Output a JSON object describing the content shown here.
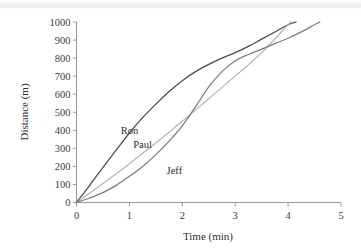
{
  "chart_data": {
    "type": "line",
    "title": "",
    "xlabel": "Time (min)",
    "ylabel": "Distance (m)",
    "xlim": [
      0,
      5
    ],
    "ylim": [
      0,
      1000
    ],
    "xticks": [
      "0",
      "1",
      "2",
      "3",
      "4",
      "5"
    ],
    "yticks": [
      "0",
      "100",
      "200",
      "300",
      "400",
      "500",
      "600",
      "700",
      "800",
      "900",
      "1000"
    ],
    "grid": false,
    "legend_position": "inline-labels",
    "series": [
      {
        "name": "Ron",
        "color": "#4a4a4a",
        "label_x": 1.0,
        "label_y": 380,
        "x": [
          0,
          0.25,
          0.5,
          0.75,
          1.0,
          1.25,
          1.5,
          1.75,
          2.0,
          2.25,
          2.5,
          2.75,
          3.0,
          3.25,
          3.5,
          3.75,
          4.0,
          4.15
        ],
        "y": [
          0,
          95,
          195,
          290,
          385,
          470,
          545,
          615,
          675,
          725,
          765,
          800,
          830,
          865,
          905,
          945,
          985,
          1000
        ]
      },
      {
        "name": "Paul",
        "color": "#b4b4b4",
        "label_x": 1.25,
        "label_y": 300,
        "x": [
          0,
          0.5,
          1.0,
          1.5,
          2.0,
          2.5,
          3.0,
          3.5,
          4.0,
          4.05
        ],
        "y": [
          0,
          105,
          215,
          330,
          450,
          575,
          700,
          830,
          985,
          1000
        ]
      },
      {
        "name": "Jeff",
        "color": "#7d7d7d",
        "label_x": 1.85,
        "label_y": 160,
        "x": [
          0,
          0.25,
          0.5,
          0.75,
          1.0,
          1.25,
          1.5,
          1.75,
          2.0,
          2.25,
          2.5,
          2.75,
          3.0,
          3.25,
          3.5,
          3.75,
          4.0,
          4.25,
          4.5,
          4.6
        ],
        "y": [
          0,
          25,
          55,
          95,
          145,
          200,
          265,
          340,
          425,
          530,
          640,
          725,
          785,
          820,
          850,
          880,
          910,
          945,
          985,
          1000
        ]
      }
    ]
  },
  "axes": {
    "x_axis_name": "time-axis",
    "y_axis_name": "distance-axis"
  }
}
